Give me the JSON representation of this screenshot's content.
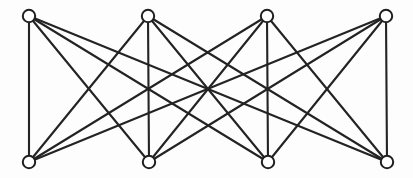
{
  "figure": {
    "graph_type": "bipartite",
    "background_color": "#fdfdfd",
    "width": 413,
    "height": 178
  },
  "style": {
    "edge_color": "#232323",
    "edge_width": 2.1,
    "node_fill": "#ffffff",
    "node_stroke": "#1f1f1f",
    "node_stroke_width": 2.0,
    "node_radius": 6.2
  },
  "chart_data": {
    "type": "diagram",
    "node_count": 8,
    "edge_count": 16,
    "partitions": [
      {
        "name": "top",
        "node_ids": [
          "t1",
          "t2",
          "t3",
          "t4"
        ]
      },
      {
        "name": "bottom",
        "node_ids": [
          "b1",
          "b2",
          "b3",
          "b4"
        ]
      }
    ],
    "nodes": [
      {
        "id": "t1",
        "label": "",
        "x": 29,
        "y": 16,
        "row": "top"
      },
      {
        "id": "t2",
        "label": "",
        "x": 148,
        "y": 16,
        "row": "top"
      },
      {
        "id": "t3",
        "label": "",
        "x": 267,
        "y": 16,
        "row": "top"
      },
      {
        "id": "t4",
        "label": "",
        "x": 386,
        "y": 16,
        "row": "top"
      },
      {
        "id": "b1",
        "label": "",
        "x": 29,
        "y": 162,
        "row": "bottom"
      },
      {
        "id": "b2",
        "label": "",
        "x": 149,
        "y": 162,
        "row": "bottom"
      },
      {
        "id": "b3",
        "label": "",
        "x": 268,
        "y": 162,
        "row": "bottom"
      },
      {
        "id": "b4",
        "label": "",
        "x": 387,
        "y": 162,
        "row": "bottom"
      }
    ],
    "edges": [
      {
        "source": "t1",
        "target": "b1"
      },
      {
        "source": "t1",
        "target": "b2"
      },
      {
        "source": "t1",
        "target": "b3"
      },
      {
        "source": "t1",
        "target": "b4"
      },
      {
        "source": "t2",
        "target": "b1"
      },
      {
        "source": "t2",
        "target": "b2"
      },
      {
        "source": "t2",
        "target": "b3"
      },
      {
        "source": "t2",
        "target": "b4"
      },
      {
        "source": "t3",
        "target": "b1"
      },
      {
        "source": "t3",
        "target": "b2"
      },
      {
        "source": "t3",
        "target": "b3"
      },
      {
        "source": "t3",
        "target": "b4"
      },
      {
        "source": "t4",
        "target": "b1"
      },
      {
        "source": "t4",
        "target": "b2"
      },
      {
        "source": "t4",
        "target": "b3"
      },
      {
        "source": "t4",
        "target": "b4"
      }
    ]
  }
}
